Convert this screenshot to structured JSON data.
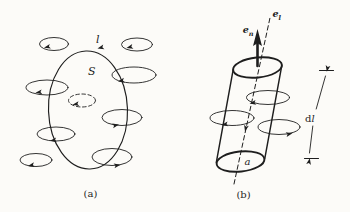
{
  "figure": {
    "paper_color": "#fcfbf8",
    "ink_color": "#1e1e1e",
    "panel_a": {
      "caption": "(a)",
      "contour_label": "l",
      "surface_label": "S"
    },
    "panel_b": {
      "caption": "(b)",
      "cross_section_label": "a",
      "length_label": {
        "d": "d",
        "l": "l"
      },
      "axis_vector": {
        "main": "e",
        "sub": "l"
      },
      "normal_vector": {
        "main": "e",
        "sub": "n"
      }
    }
  }
}
